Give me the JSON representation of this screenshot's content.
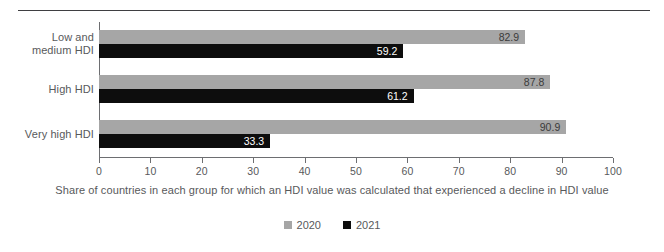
{
  "chart_data": {
    "type": "bar",
    "orientation": "horizontal",
    "title": "",
    "subtitle": "",
    "xlabel": "Share of countries in each group for which an HDI value was calculated that experienced a decline in HDI value",
    "ylabel": "",
    "xlim": [
      0,
      100
    ],
    "grid": false,
    "legend_position": "bottom-center",
    "categories": [
      "Low and medium HDI",
      "High HDI",
      "Very high HDI"
    ],
    "category_lines": [
      [
        "Low and",
        "medium HDI"
      ],
      [
        "High HDI"
      ],
      [
        "Very high HDI"
      ]
    ],
    "series": [
      {
        "name": "2020",
        "color": "#a6a6a6",
        "values": [
          82.9,
          87.8,
          90.9
        ]
      },
      {
        "name": "2021",
        "color": "#0d0d0d",
        "values": [
          59.2,
          61.2,
          33.3
        ]
      }
    ],
    "value_labels": {
      "2020": [
        "82.9",
        "87.8",
        "90.9"
      ],
      "2021": [
        "59.2",
        "61.2",
        "33.3"
      ]
    },
    "xticks": [
      0,
      10,
      20,
      30,
      40,
      50,
      60,
      70,
      80,
      90,
      100
    ],
    "xtick_labels": [
      "0",
      "10",
      "20",
      "30",
      "40",
      "50",
      "60",
      "70",
      "80",
      "90",
      "100"
    ]
  },
  "legend": {
    "items": [
      {
        "label": "2020",
        "color": "#a6a6a6"
      },
      {
        "label": "2021",
        "color": "#0d0d0d"
      }
    ]
  },
  "caption": "Share of countries in each group for which an HDI value was calculated that experienced a decline in HDI value",
  "colors": {
    "series_2020": "#a6a6a6",
    "series_2021": "#0d0d0d",
    "axis": "#6d6e71",
    "text": "#58595b",
    "rule": "#3f3f42",
    "background": "#ffffff"
  }
}
